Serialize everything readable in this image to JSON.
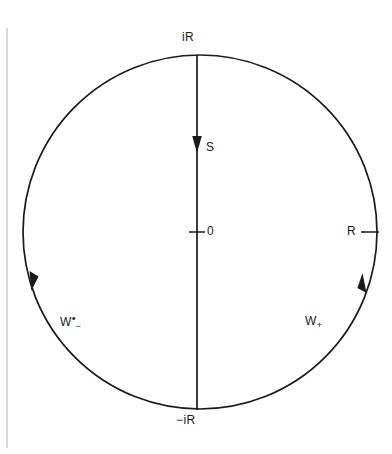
{
  "figure": {
    "type": "complex-contour-diagram",
    "background_color": "#ffffff",
    "ink_color": "#1a1a1a",
    "page_edge_color": "#b4b4b4"
  },
  "geometry": {
    "circle": {
      "center_x": 200,
      "center_y": 232,
      "radius": 177
    },
    "vertical_line": {
      "x": 197,
      "y_top": 55,
      "y_bottom": 410
    },
    "origin_tick": {
      "x": 197,
      "y": 232,
      "half_width": 8
    },
    "right_tick": {
      "x": 370,
      "y": 232,
      "half_width": 9
    },
    "page_edge_line": {
      "x": 7,
      "y_top": 28,
      "y_bottom": 448
    },
    "arrows": [
      {
        "name": "s-arrow",
        "x": 197,
        "y": 152,
        "direction": "down"
      },
      {
        "name": "w-minus-arrow",
        "x": 33,
        "y": 283,
        "direction": "down-along-left-arc"
      },
      {
        "name": "w-plus-arrow",
        "x": 361,
        "y": 290,
        "direction": "up-along-right-arc"
      }
    ]
  },
  "labels": {
    "top_imaginary": "iR",
    "bottom_imaginary": "−iR",
    "segment": "S",
    "origin": "0",
    "radius": "R",
    "left_arc_base": "W",
    "left_arc_superscript": "•",
    "left_arc_subscript": "−",
    "right_arc_base": "W",
    "right_arc_subscript": "+"
  }
}
